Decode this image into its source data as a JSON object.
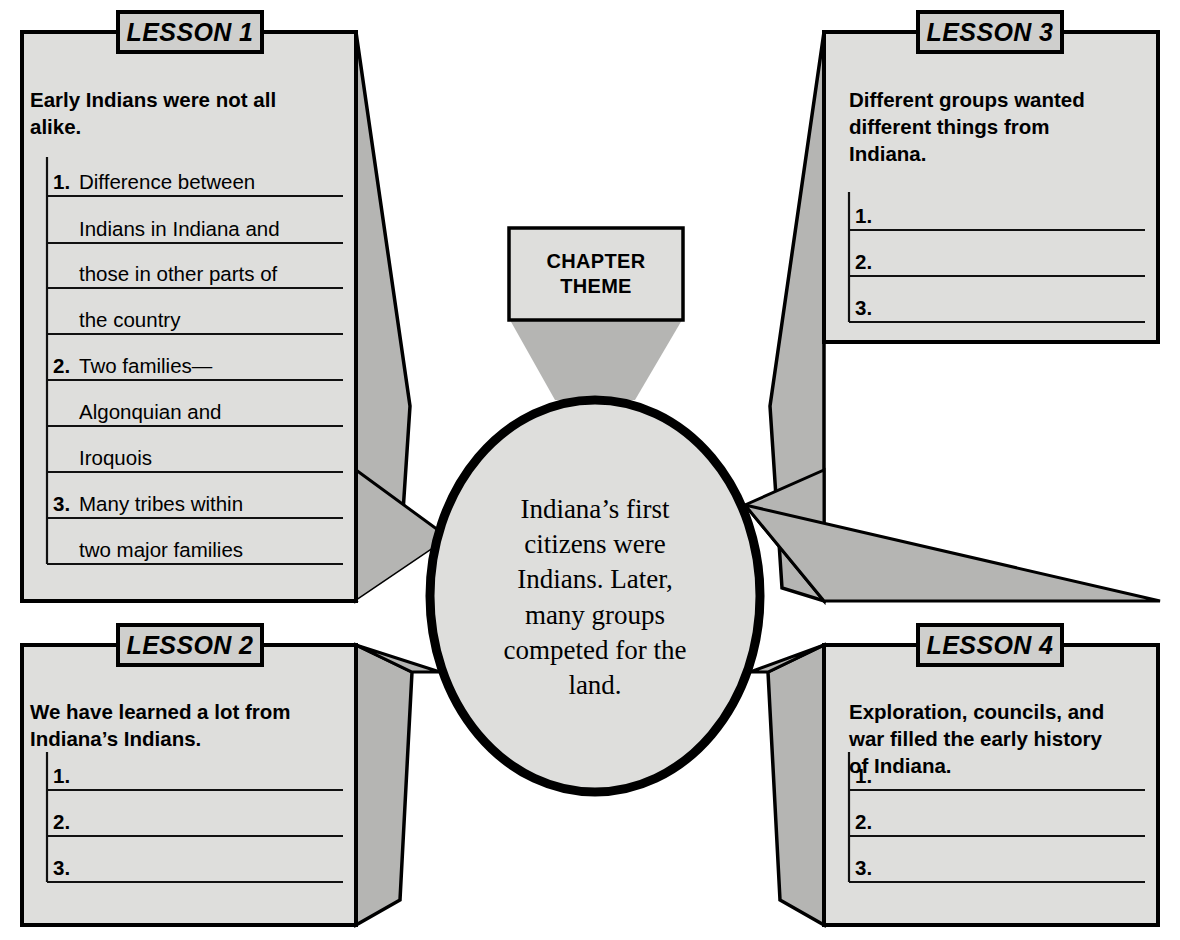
{
  "diagram": {
    "type": "graphic-organizer",
    "center": {
      "theme_box_label_line1": "CHAPTER",
      "theme_box_label_line2": "THEME",
      "summary_lines": [
        "Indiana’s first",
        "citizens were",
        "Indians. Later,",
        "many groups",
        "competed for the",
        "land."
      ]
    },
    "lessons": [
      {
        "tab": "LESSON 1",
        "heading_lines": [
          "Early Indians were not all",
          "alike."
        ],
        "items": [
          {
            "num": "1.",
            "lines": [
              "Difference between",
              "Indians in Indiana and",
              "those in other parts of",
              "the country"
            ]
          },
          {
            "num": "2.",
            "lines": [
              "Two families—",
              "Algonquian and",
              "Iroquois"
            ]
          },
          {
            "num": "3.",
            "lines": [
              "Many tribes within",
              "two major families"
            ]
          }
        ]
      },
      {
        "tab": "LESSON 2",
        "heading_lines": [
          "We have learned a lot from",
          "Indiana’s Indians."
        ],
        "items": [
          {
            "num": "1.",
            "lines": [
              ""
            ]
          },
          {
            "num": "2.",
            "lines": [
              ""
            ]
          },
          {
            "num": "3.",
            "lines": [
              ""
            ]
          }
        ]
      },
      {
        "tab": "LESSON 3",
        "heading_lines": [
          "Different groups wanted",
          "different things from",
          "Indiana."
        ],
        "items": [
          {
            "num": "1.",
            "lines": [
              ""
            ]
          },
          {
            "num": "2.",
            "lines": [
              ""
            ]
          },
          {
            "num": "3.",
            "lines": [
              ""
            ]
          }
        ]
      },
      {
        "tab": "LESSON 4",
        "heading_lines": [
          "Exploration, councils, and",
          "war filled the early history",
          "of Indiana."
        ],
        "items": [
          {
            "num": "1.",
            "lines": [
              ""
            ]
          },
          {
            "num": "2.",
            "lines": [
              ""
            ]
          },
          {
            "num": "3.",
            "lines": [
              ""
            ]
          }
        ]
      }
    ],
    "colors": {
      "paper": "#ffffff",
      "panel_fill": "#dededc",
      "tab_fill": "#cfcfcd",
      "shadow_fill": "#b5b5b3",
      "outline": "#000000",
      "rule_line": "#111111"
    }
  }
}
